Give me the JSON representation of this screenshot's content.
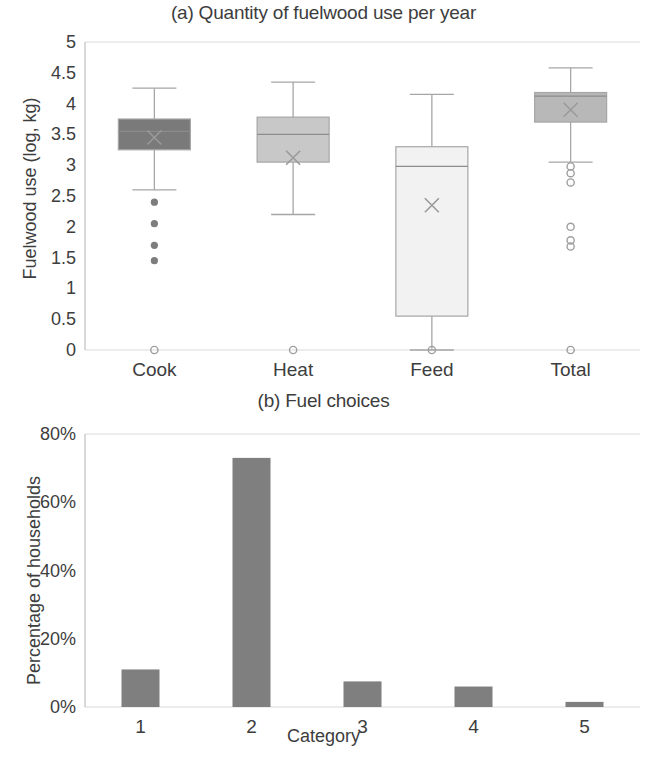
{
  "figure": {
    "panel_a_title": "(a) Quantity of fuelwood use per year",
    "panel_b_title": "(b) Fuel choices",
    "panel_a_ylabel": "Fuelwood use (log, kg)",
    "panel_b_ylabel": "Percentage of households",
    "panel_b_xlabel": "Category"
  },
  "chart_data": [
    {
      "type": "box",
      "title": "(a) Quantity of fuelwood use per year",
      "xlabel": "",
      "ylabel": "Fuelwood use (log, kg)",
      "ylim": [
        0,
        5
      ],
      "ytick_labels": [
        "0",
        "0.5",
        "1",
        "1.5",
        "2",
        "2.5",
        "3",
        "3.5",
        "4",
        "4.5",
        "5"
      ],
      "ytick_values": [
        0,
        0.5,
        1,
        1.5,
        2,
        2.5,
        3,
        3.5,
        4,
        4.5,
        5
      ],
      "grid": false,
      "legend": "none",
      "categories": [
        "Cook",
        "Heat",
        "Feed",
        "Total"
      ],
      "boxes": [
        {
          "name": "Cook",
          "whisker_low": 2.6,
          "q1": 3.25,
          "median": 3.55,
          "mean": 3.45,
          "q3": 3.75,
          "whisker_high": 4.25,
          "fill": "#7a7a7a",
          "outliers": [
            2.4,
            2.05,
            1.7,
            1.45,
            0.0
          ]
        },
        {
          "name": "Heat",
          "whisker_low": 2.2,
          "q1": 3.05,
          "median": 3.5,
          "mean": 3.12,
          "q3": 3.78,
          "whisker_high": 4.35,
          "fill": "#c8c8c8",
          "outliers": [
            0.0
          ]
        },
        {
          "name": "Feed",
          "whisker_low": 0.0,
          "q1": 0.55,
          "median": 2.98,
          "mean": 2.35,
          "q3": 3.3,
          "whisker_high": 4.15,
          "fill": "#f2f2f2",
          "outliers": [
            0.0
          ]
        },
        {
          "name": "Total",
          "whisker_low": 3.05,
          "q1": 3.7,
          "median": 4.12,
          "mean": 3.9,
          "q3": 4.18,
          "whisker_high": 4.58,
          "fill": "#b8b8b8",
          "outliers": [
            2.98,
            2.87,
            2.72,
            2.0,
            1.78,
            1.68,
            0.0
          ]
        }
      ]
    },
    {
      "type": "bar",
      "title": "(b) Fuel choices",
      "xlabel": "Category",
      "ylabel": "Percentage of households",
      "categories": [
        "1",
        "2",
        "3",
        "4",
        "5"
      ],
      "values": [
        11,
        73,
        7.5,
        6,
        1.5
      ],
      "ylim": [
        0,
        80
      ],
      "ytick_labels": [
        "0%",
        "20%",
        "40%",
        "60%",
        "80%"
      ],
      "ytick_values": [
        0,
        20,
        40,
        60,
        80
      ],
      "grid": false,
      "legend": "none",
      "bar_color": "#7f7f7f"
    }
  ]
}
